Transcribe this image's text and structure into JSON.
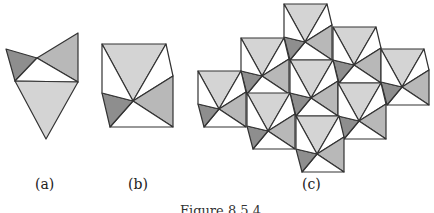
{
  "figure": {
    "caption": "Figure 8.5.4",
    "labels": {
      "a": "(a)",
      "b": "(b)",
      "c": "(c)"
    }
  },
  "colors": {
    "light": "#d4d4d4",
    "medium": "#b8b8b8",
    "dark": "#8e8e8e",
    "white": "#ffffff",
    "stroke": "#333333"
  },
  "panel_a": {
    "pieces": [
      "dark-triangle",
      "medium-triangle",
      "white-triangle",
      "light-triangle"
    ]
  },
  "panel_b": {
    "tile": "pentagon-with-center-fan"
  },
  "panel_c": {
    "tile_count": 9,
    "tile_origins": [
      [
        284,
        4
      ],
      [
        241,
        38
      ],
      [
        333,
        27
      ],
      [
        198,
        71
      ],
      [
        290,
        60
      ],
      [
        381,
        49
      ],
      [
        247,
        93
      ],
      [
        338,
        83
      ],
      [
        296,
        116
      ]
    ]
  }
}
